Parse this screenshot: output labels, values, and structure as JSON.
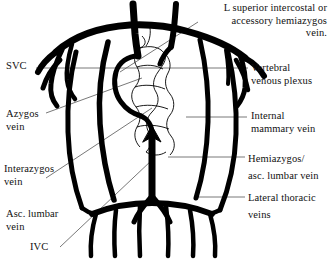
{
  "figure": {
    "kind": "anatomical-line-diagram",
    "ink_color": "#000000",
    "leader_color": "#555555",
    "background_color": "#ffffff"
  },
  "labels": {
    "l_superior_intercostal": "L superior intercostal or\naccessory hemiazygos\nvein.",
    "svc": "SVC",
    "vertebral_venous_plexus": "Vertebral\nvenous plexus",
    "azygos_vein": "Azygos\nvein",
    "internal_mammary_vein": "Internal\nmammary vein",
    "interazygos_vein": "Interazygos\nvein",
    "hemiazygos_asc_lumbar": "Hemiazygos/\nasc. lumbar vein",
    "asc_lumbar_vein": "Asc. lumbar\nvein",
    "lateral_thoracic_veins": "Lateral thoracic\nveins",
    "ivc": "IVC"
  }
}
